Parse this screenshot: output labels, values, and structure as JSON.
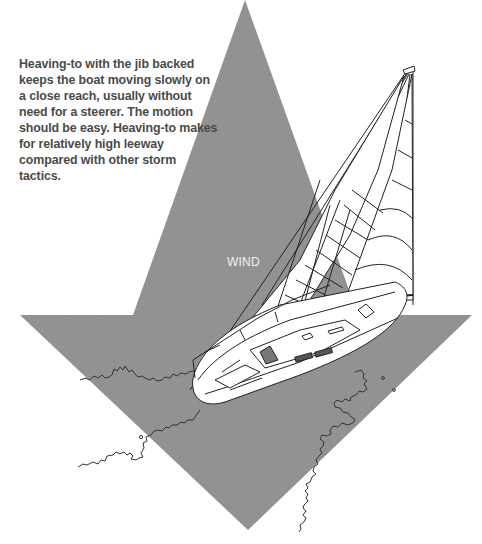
{
  "caption": {
    "text": "Heaving-to with the jib backed keeps the boat moving slowly on a close reach, usually without need for a steerer. The motion should be easy. Heaving-to makes for relatively high leeway compared with other storm tactics."
  },
  "wind_arrow": {
    "label": "WIND",
    "direction": "down",
    "fill_color": "#8e8e8e",
    "label_color": "#f2f2f2"
  },
  "boat": {
    "description": "Sailboat hove-to with jib backed, viewed from above at an angle",
    "hull_color": "#ffffff",
    "line_color": "#222222"
  },
  "colors": {
    "background": "#ffffff",
    "caption_text": "#4a4a4a"
  }
}
